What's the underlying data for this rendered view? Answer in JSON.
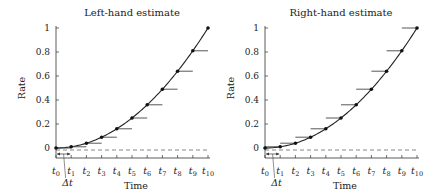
{
  "chart_data": [
    {
      "type": "line",
      "title": "Left-hand estimate",
      "xlabel": "Time",
      "ylabel": "Rate",
      "ylim": [
        0,
        1
      ],
      "yticks": [
        "0",
        "0.2",
        "0.4",
        "0.6",
        "0.8",
        "1"
      ],
      "categories": [
        "t0",
        "t1",
        "t2",
        "t3",
        "t4",
        "t5",
        "t6",
        "t7",
        "t8",
        "t9",
        "t10"
      ],
      "values": [
        0,
        0.01,
        0.04,
        0.09,
        0.16,
        0.25,
        0.36,
        0.49,
        0.64,
        0.81,
        1.0
      ],
      "estimate": "left",
      "annotation": "Δt",
      "grid": false,
      "baseline": "dashed at 0"
    },
    {
      "type": "line",
      "title": "Right-hand estimate",
      "xlabel": "Time",
      "ylabel": "Rate",
      "ylim": [
        0,
        1
      ],
      "yticks": [
        "0",
        "0.2",
        "0.4",
        "0.6",
        "0.8",
        "1"
      ],
      "categories": [
        "t0",
        "t1",
        "t2",
        "t3",
        "t4",
        "t5",
        "t6",
        "t7",
        "t8",
        "t9",
        "t10"
      ],
      "values": [
        0,
        0.01,
        0.04,
        0.09,
        0.16,
        0.25,
        0.36,
        0.49,
        0.64,
        0.81,
        1.0
      ],
      "estimate": "right",
      "annotation": "Δt",
      "grid": false,
      "baseline": "dashed at 0"
    }
  ],
  "panels": [
    {
      "title": "Left-hand estimate",
      "xlabel": "Time",
      "ylabel": "Rate",
      "delta": "Δt"
    },
    {
      "title": "Right-hand estimate",
      "xlabel": "Time",
      "ylabel": "Rate",
      "delta": "Δt"
    }
  ]
}
